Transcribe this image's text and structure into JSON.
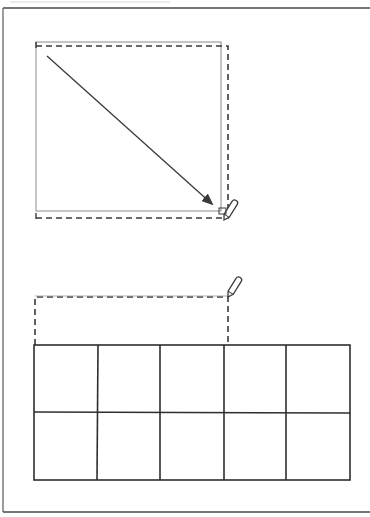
{
  "figure": {
    "type": "patent-style line drawing",
    "colors": {
      "ink": "#3a3a3a",
      "background": "#ffffff",
      "faint": "#9a9a9a"
    },
    "frame": {
      "left": 3,
      "top": 8,
      "right": 370,
      "bottom": 512
    },
    "top_panel": {
      "solid_rect": {
        "x": 36,
        "y": 42,
        "w": 185,
        "h": 169
      },
      "dashed_rect": {
        "x": 36,
        "y": 46,
        "w": 192,
        "h": 172
      },
      "arrow": {
        "x1": 47,
        "y1": 56,
        "x2": 214,
        "y2": 206
      },
      "pen": {
        "tip_x": 224,
        "tip_y": 220,
        "angle": -58
      }
    },
    "bottom_panel": {
      "dashed_rect": {
        "x": 35,
        "y": 297,
        "w": 193,
        "h": 48
      },
      "pen": {
        "tip_x": 228,
        "tip_y": 297,
        "angle": -58
      },
      "grid": {
        "x": 34,
        "y": 345,
        "w": 316,
        "h": 135,
        "rows": 2,
        "cols": 5,
        "col_lines": [
          34,
          98,
          160,
          224,
          286,
          350
        ],
        "row_lines": [
          345,
          412,
          480
        ]
      }
    }
  }
}
